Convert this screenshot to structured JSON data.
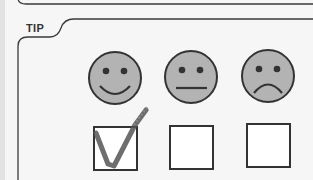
{
  "tip": {
    "label": "TIP"
  },
  "rating": {
    "options": [
      {
        "icon": "happy-face-icon",
        "checked": true
      },
      {
        "icon": "neutral-face-icon",
        "checked": false
      },
      {
        "icon": "sad-face-icon",
        "checked": false
      }
    ],
    "face_fill": "#b3b3b3",
    "stroke": "#333333",
    "check_color": "#555555"
  }
}
